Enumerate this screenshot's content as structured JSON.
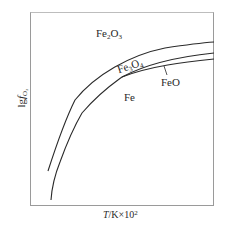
{
  "diagram": {
    "type": "phase-stability-diagram",
    "axes": {
      "x_label_var": "T",
      "x_label_unit": "/K×10",
      "x_label_exp": "2",
      "y_label_prefix": "lg",
      "y_label_var": "f",
      "y_label_sub": "O₂"
    },
    "regions": [
      {
        "id": "fe2o3",
        "base": "Fe",
        "sub1": "2",
        "mid": "O",
        "sub2": "3"
      },
      {
        "id": "fe3o4",
        "base": "Fe",
        "sub1": "3",
        "mid": "O",
        "sub2": "4"
      },
      {
        "id": "feo",
        "text": "FeO"
      },
      {
        "id": "fe",
        "text": "Fe"
      }
    ],
    "curves": [
      {
        "name": "Fe2O3/Fe3O4 boundary"
      },
      {
        "name": "Fe3O4/FeO boundary"
      },
      {
        "name": "FeO/Fe boundary"
      }
    ],
    "line_color": "#2a2a2a",
    "frame_color": "#9a9a9a"
  }
}
